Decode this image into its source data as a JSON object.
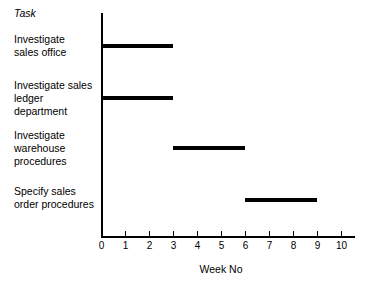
{
  "chart_data": {
    "type": "bar",
    "chart_style": "gantt",
    "title": "",
    "xlabel": "Week No",
    "ylabel": "Task",
    "xlim": [
      0,
      10.6
    ],
    "xticks": [
      0,
      1,
      2,
      3,
      4,
      5,
      6,
      7,
      8,
      9,
      10
    ],
    "xtick_labels": [
      "0",
      "1",
      "2",
      "3",
      "4",
      "5",
      "6",
      "7",
      "8",
      "9",
      "10"
    ],
    "grid": false,
    "legend": false,
    "bar_color": "#000000",
    "axis_color": "#000000",
    "background_color": "#ffffff",
    "categories": [
      "Investigate sales office",
      "Investigate sales ledger department",
      "Investigate warehouse procedures",
      "Specify sales order procedures"
    ],
    "tasks": [
      {
        "label": "Investigate\nsales office",
        "label_top_px": 33,
        "start": 0,
        "end": 3,
        "duration": 3,
        "bar_top_px": 43.5
      },
      {
        "label": "Investigate sales\nledger\ndepartment",
        "label_top_px": 79,
        "start": 0,
        "end": 3,
        "duration": 3,
        "bar_top_px": 95.5
      },
      {
        "label": "Investigate\nwarehouse\nprocedures",
        "label_top_px": 129,
        "start": 3,
        "end": 6,
        "duration": 3,
        "bar_top_px": 145.5
      },
      {
        "label": "Specify sales\norder procedures",
        "label_top_px": 185,
        "start": 6,
        "end": 9,
        "duration": 3,
        "bar_top_px": 197.5
      }
    ]
  },
  "header": {
    "task_column_title": "Task"
  },
  "axis": {
    "x_axis_title": "Week No"
  },
  "geometry": {
    "x_origin_px": 101,
    "px_per_week": 24,
    "axis_baseline_px": 236.4,
    "axis_top_px": 13
  }
}
